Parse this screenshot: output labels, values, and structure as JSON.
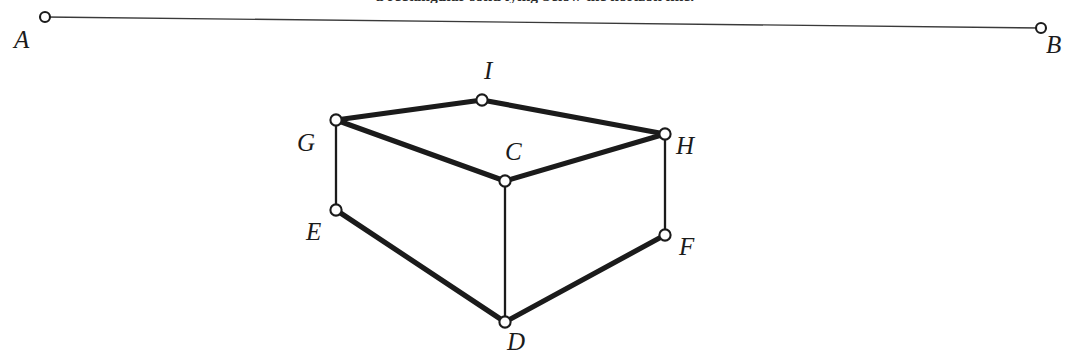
{
  "figure": {
    "title_fragment": "a rectangular solid lying below the horizon line.",
    "background_color": "#ffffff",
    "ink_color": "#1b1b1b",
    "canvas": {
      "width": 1070,
      "height": 360
    }
  },
  "horizon": {
    "name": "horizon-line",
    "stroke_color": "#3a3a3a",
    "stroke_width": 1.4,
    "from": {
      "label": "A",
      "x": 45,
      "y": 17
    },
    "to": {
      "label": "B",
      "x": 1041,
      "y": 28
    }
  },
  "points": [
    {
      "id": "A",
      "label": "A",
      "x": 45,
      "y": 17,
      "label_x": 14,
      "label_y": 27,
      "r": 5.0
    },
    {
      "id": "B",
      "label": "B",
      "x": 1041,
      "y": 28,
      "label_x": 1046,
      "label_y": 32,
      "r": 5.0
    },
    {
      "id": "G",
      "label": "G",
      "x": 336,
      "y": 120,
      "label_x": 297,
      "label_y": 130,
      "r": 5.6
    },
    {
      "id": "I",
      "label": "I",
      "x": 482,
      "y": 100,
      "label_x": 484,
      "label_y": 58,
      "r": 5.6
    },
    {
      "id": "H",
      "label": "H",
      "x": 665,
      "y": 134,
      "label_x": 676,
      "label_y": 133,
      "r": 5.6
    },
    {
      "id": "C",
      "label": "C",
      "x": 505,
      "y": 181,
      "label_x": 505,
      "label_y": 139,
      "r": 5.6
    },
    {
      "id": "E",
      "label": "E",
      "x": 336,
      "y": 210,
      "label_x": 306,
      "label_y": 219,
      "r": 5.6
    },
    {
      "id": "F",
      "label": "F",
      "x": 665,
      "y": 235,
      "label_x": 679,
      "label_y": 234,
      "r": 5.6
    },
    {
      "id": "D",
      "label": "D",
      "x": 505,
      "y": 322,
      "label_x": 507,
      "label_y": 329,
      "r": 5.6
    }
  ],
  "edges": [
    {
      "name": "edge-A-B",
      "from": "A",
      "to": "B",
      "weight": "thin",
      "stroke_width": 1.4,
      "kind": "horizon"
    },
    {
      "name": "edge-G-I",
      "from": "G",
      "to": "I",
      "weight": "thick",
      "stroke_width": 5.2,
      "kind": "top-face"
    },
    {
      "name": "edge-I-H",
      "from": "I",
      "to": "H",
      "weight": "thick",
      "stroke_width": 5.2,
      "kind": "top-face"
    },
    {
      "name": "edge-H-C",
      "from": "H",
      "to": "C",
      "weight": "thick",
      "stroke_width": 5.2,
      "kind": "top-face"
    },
    {
      "name": "edge-C-G",
      "from": "C",
      "to": "G",
      "weight": "thick",
      "stroke_width": 5.2,
      "kind": "top-face"
    },
    {
      "name": "edge-G-E",
      "from": "G",
      "to": "E",
      "weight": "thin",
      "stroke_width": 2.3,
      "kind": "vertical"
    },
    {
      "name": "edge-C-D",
      "from": "C",
      "to": "D",
      "weight": "thin",
      "stroke_width": 2.3,
      "kind": "vertical"
    },
    {
      "name": "edge-H-F",
      "from": "H",
      "to": "F",
      "weight": "thin",
      "stroke_width": 2.3,
      "kind": "vertical"
    },
    {
      "name": "edge-E-D",
      "from": "E",
      "to": "D",
      "weight": "thick",
      "stroke_width": 5.2,
      "kind": "bottom-face"
    },
    {
      "name": "edge-D-F",
      "from": "D",
      "to": "F",
      "weight": "thick",
      "stroke_width": 5.2,
      "kind": "bottom-face"
    }
  ],
  "chart_data": {
    "type": "diagram",
    "vertices": {
      "A": [
        45,
        17
      ],
      "B": [
        1041,
        28
      ],
      "G": [
        336,
        120
      ],
      "I": [
        482,
        100
      ],
      "H": [
        665,
        134
      ],
      "C": [
        505,
        181
      ],
      "E": [
        336,
        210
      ],
      "F": [
        665,
        235
      ],
      "D": [
        505,
        322
      ]
    },
    "segments": [
      [
        "A",
        "B"
      ],
      [
        "G",
        "I"
      ],
      [
        "I",
        "H"
      ],
      [
        "H",
        "C"
      ],
      [
        "C",
        "G"
      ],
      [
        "G",
        "E"
      ],
      [
        "C",
        "D"
      ],
      [
        "H",
        "F"
      ],
      [
        "E",
        "D"
      ],
      [
        "D",
        "F"
      ]
    ],
    "faces": [
      {
        "name": "top",
        "vertices": [
          "G",
          "I",
          "H",
          "C"
        ]
      },
      {
        "name": "front-left",
        "vertices": [
          "G",
          "C",
          "D",
          "E"
        ]
      },
      {
        "name": "front-right",
        "vertices": [
          "C",
          "H",
          "F",
          "D"
        ]
      }
    ],
    "marker_style": "open circle, white fill, dark outline",
    "xlabel": "",
    "ylabel": "",
    "grid": false,
    "legend": null
  }
}
